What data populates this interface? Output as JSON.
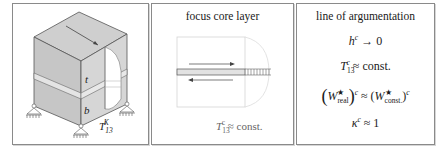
{
  "panels": [
    {
      "id": "cube-model",
      "labels": {
        "top_layer": "t",
        "bottom_layer": "b",
        "shear_label_base": "T",
        "shear_label_sub": "13",
        "shear_label_sup": "K"
      }
    },
    {
      "id": "focus-core-layer",
      "title": "focus core layer",
      "annotation": {
        "base": "T",
        "sub": "13",
        "sup": "c",
        "rhs": "≈ const."
      }
    },
    {
      "id": "line-of-argumentation",
      "title": "line of argumentation",
      "equations": [
        {
          "id": "eq1",
          "base": "h",
          "sup": "c",
          "rhs": "→ 0"
        },
        {
          "id": "eq2",
          "base": "T",
          "sub": "13",
          "sup": "c",
          "rhs": "≈ const."
        },
        {
          "id": "eq3",
          "lhs_base": "W",
          "lhs_star": "★",
          "lhs_sub": "real",
          "outer_sup": "c",
          "rel": "≈",
          "rhs_base": "W",
          "rhs_star": "★",
          "rhs_sub": "const.",
          "rhs_sup": "c"
        },
        {
          "id": "eq4",
          "base": "κ",
          "sup": "c",
          "rhs": "≈ 1"
        }
      ]
    }
  ],
  "colors": {
    "border": "#8a8a8a",
    "face_top": "#cfcfcf",
    "face_left": "#c4c4c4",
    "face_right": "#d8d8d8",
    "core_band": "#e6e6e6",
    "line": "#555555"
  }
}
